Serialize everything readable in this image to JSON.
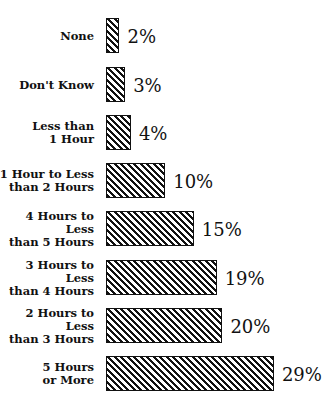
{
  "chart_data": {
    "type": "bar",
    "orientation": "horizontal",
    "title": "",
    "xlabel": "",
    "ylabel": "",
    "categories": [
      "None",
      "Don't Know",
      "Less than\n1 Hour",
      "1 Hour to Less\nthan 2 Hours",
      "4 Hours to Less\nthan 5 Hours",
      "3 Hours to Less\nthan 4 Hours",
      "2 Hours to Less\nthan 3 Hours",
      "5 Hours\nor More"
    ],
    "values": [
      2,
      3,
      4,
      10,
      15,
      19,
      20,
      29
    ],
    "value_labels": [
      "2%",
      "3%",
      "4%",
      "10%",
      "15%",
      "19%",
      "20%",
      "29%"
    ],
    "unit": "%",
    "grid": false,
    "legend": null,
    "bar_fill": "diagonal-hatch",
    "bar_color": "#111111"
  }
}
